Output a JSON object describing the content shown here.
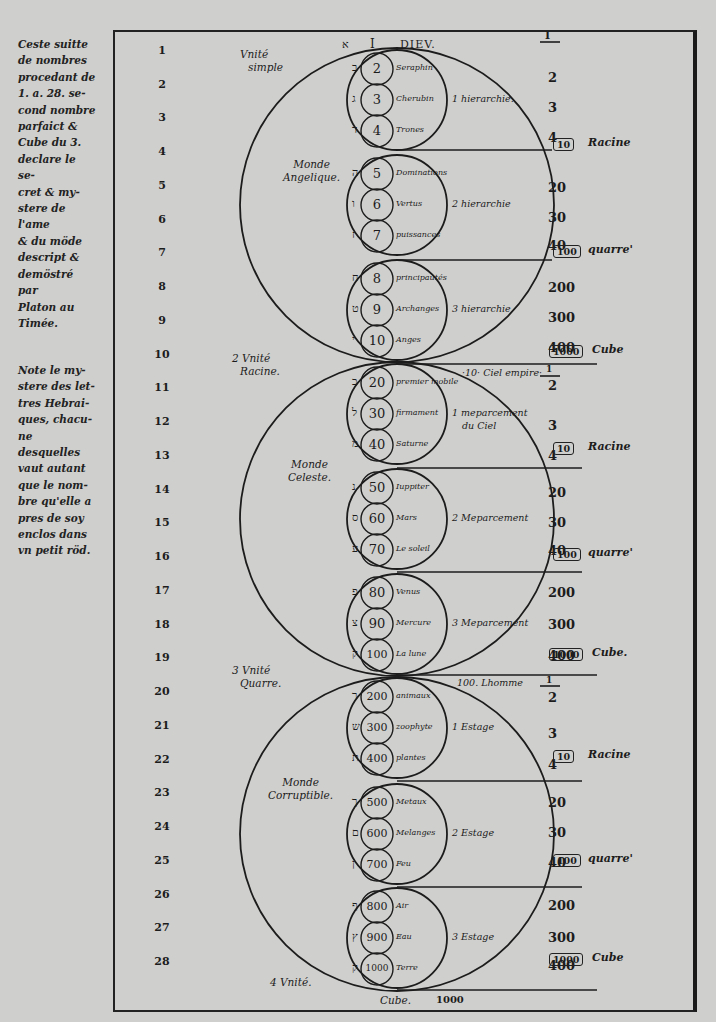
{
  "sidenotes": {
    "note1": [
      "Ceste suitte",
      "de nombres",
      "procedant de",
      "1. a. 28. se-",
      "cond nombre",
      "parfaict &",
      "Cube du 3.",
      "declare le se-",
      "cret & my-",
      "stere de l'ame",
      "& du möde",
      "descript &",
      "demöstré par",
      "Platon au",
      "Timée."
    ],
    "note2": [
      "Note le my-",
      "stere des let-",
      "tres Hebrai-",
      "ques, chacu-",
      "ne desquelles",
      "vaut autant",
      "que le nom-",
      "bre qu'elle a",
      "pres de soy",
      "enclos dans",
      "vn petit röd."
    ]
  },
  "header": {
    "hebrew_letter": "א",
    "numeral": "I",
    "title": "DIEV.",
    "fraction_top": "I"
  },
  "left_numbers": [
    "1",
    "2",
    "3",
    "4",
    "5",
    "6",
    "7",
    "8",
    "9",
    "10",
    "11",
    "12",
    "13",
    "14",
    "15",
    "16",
    "17",
    "18",
    "19",
    "20",
    "21",
    "22",
    "23",
    "24",
    "25",
    "26",
    "27",
    "28"
  ],
  "unity_labels": [
    {
      "label": "Vnité",
      "sub": "simple",
      "prefix": ""
    },
    {
      "label": "Vnité",
      "sub": "Racine.",
      "prefix": "2"
    },
    {
      "label": "Vnité",
      "sub": "Quarre.",
      "prefix": "3"
    },
    {
      "label": "Vnité.",
      "sub": "",
      "prefix": "4"
    }
  ],
  "worlds": [
    {
      "name": "Monde",
      "name2": "Angelique.",
      "apex_label": "",
      "hierarchies": [
        {
          "label": "1 hierarchie.",
          "items": [
            {
              "hebrew": "ב",
              "value": "2",
              "name": "Seraphin"
            },
            {
              "hebrew": "ג",
              "value": "3",
              "name": "Cherubin"
            },
            {
              "hebrew": "ד",
              "value": "4",
              "name": "Trones"
            }
          ]
        },
        {
          "label": "2 hierarchie",
          "items": [
            {
              "hebrew": "ה",
              "value": "5",
              "name": "Dominations"
            },
            {
              "hebrew": "ו",
              "value": "6",
              "name": "Vertus"
            },
            {
              "hebrew": "ז",
              "value": "7",
              "name": "puissances"
            }
          ]
        },
        {
          "label": "3 hierarchie",
          "items": [
            {
              "hebrew": "ח",
              "value": "8",
              "name": "principautés"
            },
            {
              "hebrew": "ט",
              "value": "9",
              "name": "Archanges"
            },
            {
              "hebrew": "י",
              "value": "10",
              "name": "Anges"
            }
          ]
        }
      ]
    },
    {
      "name": "Monde",
      "name2": "Celeste.",
      "apex_label": "·10· Ciel empire·",
      "hierarchies": [
        {
          "label": "1 meparcement",
          "label2": "du Ciel",
          "items": [
            {
              "hebrew": "כ",
              "value": "20",
              "name": "premier mobile"
            },
            {
              "hebrew": "ל",
              "value": "30",
              "name": "firmament"
            },
            {
              "hebrew": "מ",
              "value": "40",
              "name": "Saturne"
            }
          ]
        },
        {
          "label": "2 Meparcement",
          "items": [
            {
              "hebrew": "נ",
              "value": "50",
              "name": "Iuppiter"
            },
            {
              "hebrew": "ס",
              "value": "60",
              "name": "Mars"
            },
            {
              "hebrew": "ע",
              "value": "70",
              "name": "Le soleil"
            }
          ]
        },
        {
          "label": "3 Meparcement",
          "items": [
            {
              "hebrew": "פ",
              "value": "80",
              "name": "Venus"
            },
            {
              "hebrew": "צ",
              "value": "90",
              "name": "Mercure"
            },
            {
              "hebrew": "ק",
              "value": "100",
              "name": "La lune"
            }
          ]
        }
      ]
    },
    {
      "name": "Monde",
      "name2": "Corruptible.",
      "apex_label": "100. Lhomme",
      "hierarchies": [
        {
          "label": "1 Estage",
          "items": [
            {
              "hebrew": "ר",
              "value": "200",
              "name": "animaux"
            },
            {
              "hebrew": "ש",
              "value": "300",
              "name": "zoophyte"
            },
            {
              "hebrew": "ת",
              "value": "400",
              "name": "plantes"
            }
          ]
        },
        {
          "label": "2 Estage",
          "items": [
            {
              "hebrew": "ך",
              "value": "500",
              "name": "Metaux"
            },
            {
              "hebrew": "ם",
              "value": "600",
              "name": "Melanges"
            },
            {
              "hebrew": "ן",
              "value": "700",
              "name": "Feu"
            }
          ]
        },
        {
          "label": "3 Estage",
          "items": [
            {
              "hebrew": "ף",
              "value": "800",
              "name": "Air"
            },
            {
              "hebrew": "ץ",
              "value": "900",
              "name": "Eau"
            },
            {
              "hebrew": "ק",
              "value": "1000",
              "name": "Terre"
            }
          ]
        }
      ]
    }
  ],
  "right_column": [
    {
      "values": [
        "1",
        "2",
        "3",
        "4"
      ],
      "box": "10",
      "label": "Racine"
    },
    {
      "values": [
        "20",
        "30",
        "40"
      ],
      "box": "100",
      "label": "quarre'"
    },
    {
      "values": [
        "200",
        "300",
        "400"
      ],
      "box": "1000",
      "label": "Cube"
    },
    {
      "values": [
        "1",
        "2",
        "3",
        "4"
      ],
      "box": "10",
      "label": "Racine"
    },
    {
      "values": [
        "20",
        "30",
        "40"
      ],
      "box": "100",
      "label": "quarre'"
    },
    {
      "values": [
        "200",
        "300",
        "400"
      ],
      "box": "1000",
      "label": "Cube."
    },
    {
      "values": [
        "1",
        "2",
        "3",
        "4"
      ],
      "box": "10",
      "label": "Racine"
    },
    {
      "values": [
        "20",
        "30",
        "40"
      ],
      "box": "100",
      "label": "quarre'"
    },
    {
      "values": [
        "200",
        "300",
        "400"
      ],
      "box": "1000",
      "label": "Cube"
    }
  ],
  "footer": {
    "cube_label": "Cube.",
    "cube_value": "1000"
  },
  "colors": {
    "paper": "#cfcfcd",
    "ink": "#1c1c1c"
  }
}
